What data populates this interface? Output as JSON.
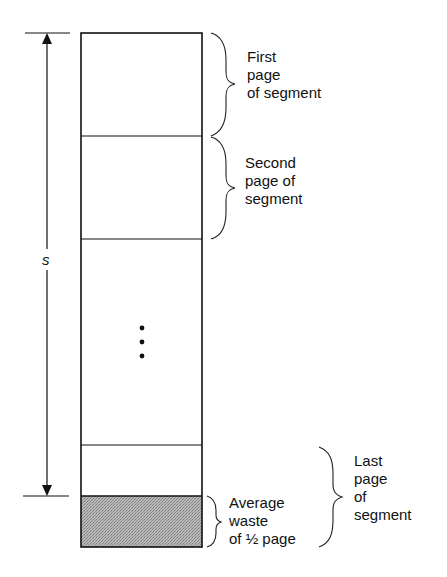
{
  "diagram": {
    "size_label": "s",
    "labels": {
      "first_page": "First\npage\nof segment",
      "second_page": "Second\npage of\nsegment",
      "average_waste": "Average\nwaste\nof ½ page",
      "last_page": "Last\npage\nof\nsegment"
    },
    "colors": {
      "line": "#111111",
      "waste_fill": "#a9a9a9",
      "background": "#ffffff"
    },
    "segment_blocks": [
      {
        "name": "first-page",
        "y_top": 33,
        "y_bottom": 136
      },
      {
        "name": "second-page",
        "y_top": 136,
        "y_bottom": 239
      },
      {
        "name": "middle-pages",
        "y_top": 239,
        "y_bottom": 445
      },
      {
        "name": "last-page-used",
        "y_top": 445,
        "y_bottom": 496
      },
      {
        "name": "last-page-waste",
        "y_top": 496,
        "y_bottom": 547
      }
    ],
    "ellipsis": "⋮"
  }
}
